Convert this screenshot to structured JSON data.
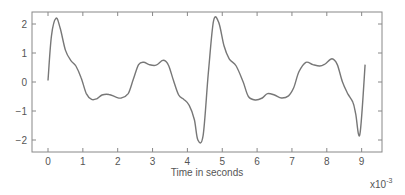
{
  "chart_data": {
    "type": "line",
    "title": "",
    "xlabel": "Time in seconds",
    "ylabel": "",
    "x_multiplier_label": "x10",
    "x_multiplier_exponent": "-3",
    "xlim": [
      -0.45,
      9.6
    ],
    "ylim": [
      -2.3,
      2.5
    ],
    "xticks": [
      0,
      1,
      2,
      3,
      4,
      5,
      6,
      7,
      8,
      9
    ],
    "xtick_labels": [
      "0",
      "1",
      "2",
      "3",
      "4",
      "5",
      "6",
      "7",
      "8",
      "9"
    ],
    "yticks": [
      2,
      1,
      0,
      -1,
      -2
    ],
    "ytick_labels": [
      "2",
      "1",
      "0",
      "−1",
      "−2"
    ],
    "grid": false,
    "legend": null,
    "line_color": "#777777",
    "series": [
      {
        "name": "signal",
        "x": [
          0.0,
          0.1,
          0.23,
          0.35,
          0.5,
          0.65,
          0.8,
          0.95,
          1.1,
          1.25,
          1.4,
          1.55,
          1.75,
          1.95,
          2.1,
          2.3,
          2.45,
          2.6,
          2.75,
          2.9,
          3.1,
          3.3,
          3.45,
          3.6,
          3.75,
          3.9,
          4.05,
          4.2,
          4.3,
          4.45,
          4.6,
          4.75,
          4.9,
          5.05,
          5.2,
          5.4,
          5.6,
          5.75,
          5.95,
          6.15,
          6.3,
          6.5,
          6.7,
          6.9,
          7.05,
          7.2,
          7.4,
          7.6,
          7.8,
          7.95,
          8.15,
          8.3,
          8.45,
          8.6,
          8.75,
          8.83,
          8.95,
          9.1
        ],
        "values": [
          0.05,
          1.6,
          2.2,
          1.85,
          1.1,
          0.75,
          0.55,
          0.15,
          -0.4,
          -0.6,
          -0.58,
          -0.45,
          -0.43,
          -0.52,
          -0.55,
          -0.4,
          0.1,
          0.6,
          0.68,
          0.6,
          0.58,
          0.75,
          0.6,
          0.05,
          -0.45,
          -0.6,
          -0.8,
          -1.3,
          -2.0,
          -1.85,
          0.3,
          2.1,
          2.05,
          1.25,
          0.8,
          0.55,
          0.0,
          -0.5,
          -0.62,
          -0.55,
          -0.4,
          -0.45,
          -0.55,
          -0.48,
          -0.2,
          0.35,
          0.68,
          0.6,
          0.55,
          0.62,
          0.8,
          0.6,
          0.0,
          -0.4,
          -0.7,
          -1.1,
          -1.8,
          0.6
        ]
      }
    ]
  }
}
